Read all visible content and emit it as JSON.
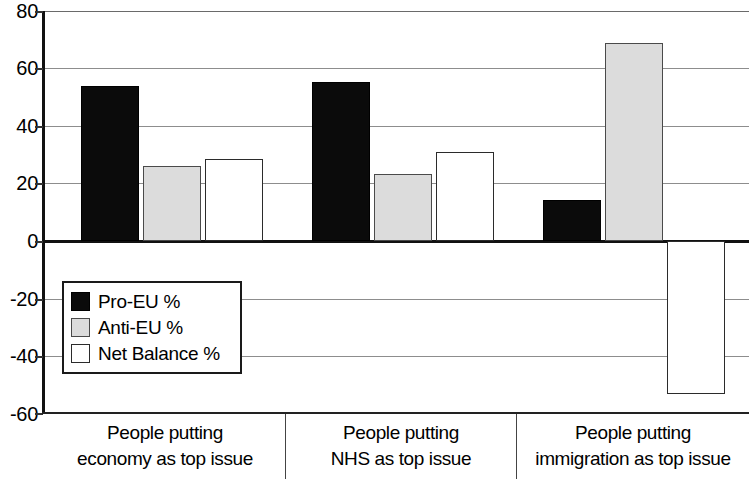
{
  "chart_data": {
    "type": "bar",
    "title": "",
    "subtitle": "",
    "xlabel": "",
    "ylabel": "",
    "ylim": [
      -60,
      80
    ],
    "y_ticks": [
      80,
      60,
      40,
      20,
      0,
      -20,
      -40,
      -60
    ],
    "y_tick_labels": [
      "80",
      "60",
      "40",
      "20",
      "0",
      "-20",
      "-40",
      "-60"
    ],
    "grid": true,
    "legend_position": "inside-left-lower",
    "categories": [
      "People putting economy as top issue",
      "People putting NHS as top issue",
      "People putting immigration as top issue"
    ],
    "category_lines": [
      [
        "People putting",
        "economy as top issue"
      ],
      [
        "People putting",
        "NHS as top issue"
      ],
      [
        "People putting",
        "immigration as top issue"
      ]
    ],
    "series": [
      {
        "name": "Pro-EU %",
        "color": "#0b0b0b",
        "values": [
          54,
          55.5,
          14.5
        ]
      },
      {
        "name": "Anti-EU %",
        "color": "#dcdcdc",
        "values": [
          26,
          23.5,
          69
        ]
      },
      {
        "name": "Net Balance %",
        "color": "#ffffff",
        "values": [
          28.5,
          31,
          -53
        ]
      }
    ]
  },
  "legend": {
    "items": [
      {
        "label": "Pro-EU %"
      },
      {
        "label": "Anti-EU %"
      },
      {
        "label": "Net Balance %"
      }
    ]
  },
  "axis": {
    "y_labels": [
      "80",
      "60",
      "40",
      "20",
      "0",
      "-20",
      "-40",
      "-60"
    ]
  }
}
